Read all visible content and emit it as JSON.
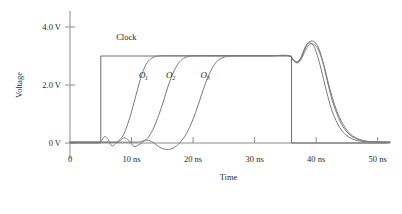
{
  "chart_data": {
    "type": "line",
    "title": "",
    "xlabel": "Time",
    "ylabel": "Voltage",
    "xlim": [
      0,
      52
    ],
    "ylim": [
      -0.6,
      4.6
    ],
    "grid": false,
    "legend": "inline-labels",
    "x_ticks": [
      {
        "value": 0,
        "label": "0"
      },
      {
        "value": 10,
        "label": "10 ns"
      },
      {
        "value": 20,
        "label": "20 ns"
      },
      {
        "value": 30,
        "label": "30 ns"
      },
      {
        "value": 40,
        "label": "40 ns"
      },
      {
        "value": 50,
        "label": "50 ns"
      }
    ],
    "y_ticks": [
      {
        "value": 0,
        "label": "0 V"
      },
      {
        "value": 2,
        "label": "2.0 V"
      },
      {
        "value": 4,
        "label": "4.0 V"
      }
    ],
    "annotations": [
      {
        "text": "Clock",
        "x": 7.5,
        "y": 3.55
      },
      {
        "text": "O",
        "sub": "1",
        "x": 11.2,
        "y": 2.25
      },
      {
        "text": "O",
        "sub": "2",
        "x": 15.6,
        "y": 2.25
      },
      {
        "text": "O",
        "sub": "3",
        "x": 21.2,
        "y": 2.25
      }
    ],
    "series": [
      {
        "name": "Clock",
        "color": "#6e6e6e",
        "description": "Ideal square pulse, rises at 5 ns to 3.0 V, falls at 36 ns to 0 V",
        "points": [
          [
            0,
            0
          ],
          [
            5,
            0
          ],
          [
            5,
            3.0
          ],
          [
            36,
            3.0
          ],
          [
            36,
            0
          ],
          [
            52,
            0
          ]
        ]
      },
      {
        "name": "O1",
        "color": "#7a7a7a",
        "description": "First buffered output, rises ~8-14 ns with small pre-ripple, overshoots to 3.45 V after clock falls",
        "points": [
          [
            0,
            0.03
          ],
          [
            4.0,
            0.03
          ],
          [
            5.0,
            0.05
          ],
          [
            5.6,
            0.22
          ],
          [
            6.2,
            0.12
          ],
          [
            6.8,
            -0.1
          ],
          [
            7.4,
            -0.02
          ],
          [
            8.0,
            0.1
          ],
          [
            8.6,
            0.25
          ],
          [
            9.2,
            0.55
          ],
          [
            9.9,
            1.0
          ],
          [
            10.6,
            1.55
          ],
          [
            11.3,
            2.1
          ],
          [
            12.0,
            2.55
          ],
          [
            12.7,
            2.82
          ],
          [
            13.5,
            2.95
          ],
          [
            14.3,
            3.0
          ],
          [
            16,
            3.01
          ],
          [
            20,
            3.01
          ],
          [
            26,
            3.01
          ],
          [
            32,
            3.01
          ],
          [
            35.5,
            3.01
          ],
          [
            36.3,
            2.88
          ],
          [
            36.9,
            2.8
          ],
          [
            37.4,
            2.9
          ],
          [
            37.9,
            3.15
          ],
          [
            38.4,
            3.38
          ],
          [
            38.9,
            3.45
          ],
          [
            39.4,
            3.4
          ],
          [
            39.9,
            3.2
          ],
          [
            40.5,
            2.8
          ],
          [
            41.2,
            2.2
          ],
          [
            41.9,
            1.6
          ],
          [
            42.6,
            1.1
          ],
          [
            43.4,
            0.7
          ],
          [
            44.2,
            0.42
          ],
          [
            45.0,
            0.25
          ],
          [
            46.0,
            0.13
          ],
          [
            47.0,
            0.07
          ],
          [
            48.5,
            0.04
          ],
          [
            52,
            0.03
          ]
        ]
      },
      {
        "name": "O2",
        "color": "#7a7a7a",
        "description": "Second buffered output, rises ~12-19 ns, overshoots to 3.52 V after clock falls",
        "points": [
          [
            0,
            0.03
          ],
          [
            7.0,
            0.03
          ],
          [
            8.0,
            0.06
          ],
          [
            8.8,
            0.18
          ],
          [
            9.6,
            0.08
          ],
          [
            10.4,
            -0.12
          ],
          [
            11.2,
            -0.06
          ],
          [
            12.0,
            0.06
          ],
          [
            12.8,
            0.22
          ],
          [
            13.6,
            0.52
          ],
          [
            14.4,
            0.95
          ],
          [
            15.2,
            1.45
          ],
          [
            16.0,
            2.0
          ],
          [
            16.9,
            2.48
          ],
          [
            17.8,
            2.8
          ],
          [
            18.7,
            2.94
          ],
          [
            19.7,
            3.0
          ],
          [
            22,
            3.01
          ],
          [
            28,
            3.01
          ],
          [
            33,
            3.01
          ],
          [
            35.5,
            3.01
          ],
          [
            36.3,
            2.86
          ],
          [
            36.9,
            2.78
          ],
          [
            37.5,
            2.92
          ],
          [
            38.1,
            3.22
          ],
          [
            38.7,
            3.45
          ],
          [
            39.3,
            3.52
          ],
          [
            39.9,
            3.45
          ],
          [
            40.5,
            3.22
          ],
          [
            41.1,
            2.78
          ],
          [
            41.8,
            2.15
          ],
          [
            42.5,
            1.55
          ],
          [
            43.3,
            1.05
          ],
          [
            44.1,
            0.66
          ],
          [
            45.0,
            0.38
          ],
          [
            46.0,
            0.2
          ],
          [
            47.2,
            0.1
          ],
          [
            48.6,
            0.05
          ],
          [
            52,
            0.03
          ]
        ]
      },
      {
        "name": "O3",
        "color": "#7a7a7a",
        "description": "Third buffered output, rises ~17-25 ns with deepest pre-ripple, overshoots to 3.42 V after clock falls",
        "points": [
          [
            0,
            0.03
          ],
          [
            10.0,
            0.03
          ],
          [
            11.5,
            0.05
          ],
          [
            12.5,
            0.1
          ],
          [
            13.5,
            0.02
          ],
          [
            14.5,
            -0.14
          ],
          [
            15.5,
            -0.22
          ],
          [
            16.5,
            -0.2
          ],
          [
            17.3,
            -0.1
          ],
          [
            18.0,
            0.05
          ],
          [
            18.8,
            0.28
          ],
          [
            19.6,
            0.62
          ],
          [
            20.4,
            1.05
          ],
          [
            21.2,
            1.55
          ],
          [
            22.0,
            2.05
          ],
          [
            22.9,
            2.5
          ],
          [
            23.8,
            2.8
          ],
          [
            24.8,
            2.94
          ],
          [
            25.9,
            3.0
          ],
          [
            28,
            3.01
          ],
          [
            32,
            3.01
          ],
          [
            35.5,
            3.01
          ],
          [
            36.3,
            2.84
          ],
          [
            37.0,
            2.76
          ],
          [
            37.6,
            2.9
          ],
          [
            38.2,
            3.18
          ],
          [
            38.8,
            3.38
          ],
          [
            39.4,
            3.42
          ],
          [
            40.0,
            3.34
          ],
          [
            40.6,
            3.1
          ],
          [
            41.3,
            2.65
          ],
          [
            42.0,
            2.05
          ],
          [
            42.8,
            1.45
          ],
          [
            43.6,
            0.98
          ],
          [
            44.5,
            0.6
          ],
          [
            45.4,
            0.34
          ],
          [
            46.4,
            0.18
          ],
          [
            47.6,
            0.09
          ],
          [
            49.0,
            0.04
          ],
          [
            52,
            0.03
          ]
        ]
      }
    ]
  }
}
